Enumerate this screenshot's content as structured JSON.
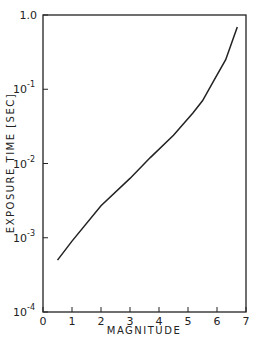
{
  "chart_data": {
    "type": "line",
    "title": "",
    "xlabel": "MAGNITUDE",
    "ylabel": "EXPOSURE TIME [SEC]",
    "xlim": [
      0,
      7
    ],
    "ylim": [
      0.0001,
      1.0
    ],
    "yscale": "log",
    "grid": false,
    "legend": null,
    "x_ticks": [
      "0",
      "1",
      "2",
      "3",
      "4",
      "5",
      "6",
      "7"
    ],
    "y_ticks": [
      "10^-4",
      "10^-3",
      "10^-2",
      "10^-1",
      "1.0"
    ],
    "series": [
      {
        "name": "exposure time",
        "x": [
          0.5,
          1.0,
          2.0,
          3.0,
          3.7,
          4.5,
          5.17,
          5.5,
          5.9,
          6.3,
          6.7
        ],
        "y": [
          0.0005,
          0.0009,
          0.0027,
          0.0063,
          0.012,
          0.024,
          0.048,
          0.07,
          0.133,
          0.25,
          0.69
        ]
      }
    ]
  }
}
